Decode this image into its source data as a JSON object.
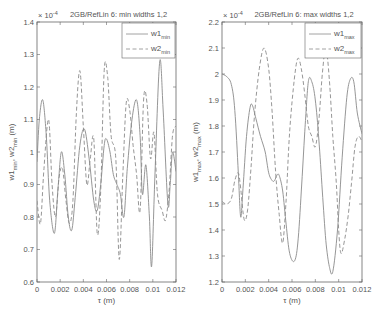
{
  "chart_data": [
    {
      "type": "line",
      "title": "2GB/RefLin 6: min widths 1,2",
      "xlabel": "τ (m)",
      "ylabel": "w1_min, w2_min (m)",
      "y_multiplier": "× 10^-4",
      "xlim": [
        0,
        0.012
      ],
      "ylim": [
        0.6,
        1.4
      ],
      "xticks": [
        "0",
        "0.002",
        "0.004",
        "0.006",
        "0.008",
        "0.01",
        "0.012"
      ],
      "yticks": [
        "0.6",
        "0.7",
        "0.8",
        "0.9",
        "1",
        "1.1",
        "1.2",
        "1.3",
        "1.4"
      ],
      "grid": false,
      "legend_position": "upper right",
      "series": [
        {
          "name": "w1min",
          "label_main": "w1",
          "label_sub": "min",
          "style": "solid",
          "x": [
            0,
            0.0002,
            0.0005,
            0.0008,
            0.0011,
            0.0015,
            0.0018,
            0.0021,
            0.0024,
            0.0027,
            0.003,
            0.0033,
            0.0037,
            0.0041,
            0.0045,
            0.0049,
            0.0052,
            0.0055,
            0.0058,
            0.006,
            0.0063,
            0.0066,
            0.0069,
            0.0072,
            0.0075,
            0.0078,
            0.0082,
            0.0086,
            0.0089,
            0.0091,
            0.0094,
            0.0097,
            0.0099,
            0.0102,
            0.0106,
            0.0109,
            0.0113,
            0.0115,
            0.0117,
            0.012
          ],
          "values": [
            0.97,
            1.1,
            1.16,
            1.05,
            0.85,
            0.75,
            0.88,
            1.0,
            0.93,
            0.8,
            0.76,
            0.86,
            1.02,
            1.07,
            0.98,
            0.85,
            0.82,
            0.9,
            1.02,
            1.04,
            1.0,
            0.93,
            0.9,
            0.87,
            0.8,
            0.95,
            1.1,
            1.16,
            1.05,
            0.87,
            0.96,
            0.8,
            0.65,
            0.95,
            1.28,
            1.12,
            0.84,
            0.9,
            1.0,
            0.94
          ]
        },
        {
          "name": "w2min",
          "label_main": "w2",
          "label_sub": "min",
          "style": "dashed",
          "x": [
            0,
            0.0003,
            0.0006,
            0.001,
            0.0013,
            0.0016,
            0.0019,
            0.0022,
            0.0025,
            0.0028,
            0.0031,
            0.0034,
            0.0037,
            0.004,
            0.0043,
            0.0046,
            0.0049,
            0.0052,
            0.0055,
            0.0058,
            0.0061,
            0.0064,
            0.0068,
            0.0071,
            0.0074,
            0.0077,
            0.008,
            0.0083,
            0.0086,
            0.0089,
            0.0092,
            0.0095,
            0.0098,
            0.0101,
            0.0104,
            0.0108,
            0.0111,
            0.0114,
            0.0117,
            0.012
          ],
          "values": [
            0.85,
            0.78,
            0.95,
            1.1,
            0.9,
            0.8,
            0.92,
            0.95,
            0.85,
            0.78,
            0.85,
            1.12,
            1.25,
            1.08,
            0.9,
            0.98,
            1.04,
            0.75,
            0.88,
            1.25,
            1.23,
            1.05,
            0.98,
            0.67,
            0.92,
            1.15,
            1.13,
            1.02,
            0.93,
            0.82,
            1.16,
            1.15,
            0.98,
            1.06,
            0.87,
            0.82,
            0.79,
            0.88,
            1.05,
            1.08
          ]
        }
      ]
    },
    {
      "type": "line",
      "title": "2GB/RefLin 6: max widths 1,2",
      "xlabel": "τ (m)",
      "ylabel": "w1_max, w2_max (m)",
      "y_multiplier": "× 10^-4",
      "xlim": [
        0,
        0.012
      ],
      "ylim": [
        1.2,
        2.2
      ],
      "xticks": [
        "0",
        "0.002",
        "0.004",
        "0.006",
        "0.008",
        "0.01",
        "0.012"
      ],
      "yticks": [
        "1.2",
        "1.3",
        "1.4",
        "1.5",
        "1.6",
        "1.7",
        "1.8",
        "1.9",
        "2",
        "2.1",
        "2.2"
      ],
      "grid": false,
      "legend_position": "upper right",
      "series": [
        {
          "name": "w1max",
          "label_main": "w1",
          "label_sub": "max",
          "style": "solid",
          "x": [
            0,
            0.0004,
            0.0008,
            0.0011,
            0.0014,
            0.0016,
            0.0018,
            0.0021,
            0.0024,
            0.0026,
            0.0029,
            0.0033,
            0.0037,
            0.004,
            0.0043,
            0.0045,
            0.0047,
            0.0049,
            0.0052,
            0.0055,
            0.0058,
            0.0062,
            0.0065,
            0.0068,
            0.0071,
            0.0074,
            0.0077,
            0.008,
            0.0083,
            0.0086,
            0.0089,
            0.0092,
            0.0095,
            0.0099,
            0.0103,
            0.0107,
            0.011,
            0.0113,
            0.0116,
            0.012
          ],
          "values": [
            2.0,
            1.99,
            1.96,
            1.86,
            1.62,
            1.45,
            1.56,
            1.76,
            1.87,
            1.88,
            1.83,
            1.76,
            1.7,
            1.62,
            1.59,
            1.59,
            1.61,
            1.61,
            1.55,
            1.42,
            1.31,
            1.28,
            1.35,
            1.55,
            1.78,
            1.97,
            1.97,
            1.9,
            1.75,
            1.55,
            1.36,
            1.26,
            1.24,
            1.4,
            1.68,
            1.91,
            1.98,
            1.97,
            1.85,
            1.77
          ]
        },
        {
          "name": "w2max",
          "label_main": "w2",
          "label_sub": "max",
          "style": "dashed",
          "x": [
            0,
            0.0004,
            0.0008,
            0.0011,
            0.0014,
            0.0016,
            0.0019,
            0.0022,
            0.0025,
            0.0028,
            0.0032,
            0.0036,
            0.004,
            0.0043,
            0.0046,
            0.0049,
            0.0052,
            0.0055,
            0.0058,
            0.0062,
            0.0065,
            0.0068,
            0.0071,
            0.0074,
            0.0077,
            0.008,
            0.0083,
            0.0086,
            0.0089,
            0.0092,
            0.0095,
            0.0098,
            0.01,
            0.0102,
            0.0105,
            0.0108,
            0.0111,
            0.0114,
            0.0117,
            0.012
          ],
          "values": [
            1.51,
            1.5,
            1.52,
            1.59,
            1.62,
            1.56,
            1.44,
            1.48,
            1.65,
            1.85,
            2.02,
            2.1,
            2.02,
            1.85,
            1.62,
            1.46,
            1.35,
            1.52,
            1.78,
            1.98,
            2.06,
            2.02,
            1.92,
            1.8,
            1.76,
            1.72,
            1.82,
            2.0,
            2.1,
            1.98,
            1.76,
            1.58,
            1.4,
            1.31,
            1.36,
            1.45,
            1.58,
            1.72,
            1.76,
            1.74
          ]
        }
      ]
    }
  ]
}
